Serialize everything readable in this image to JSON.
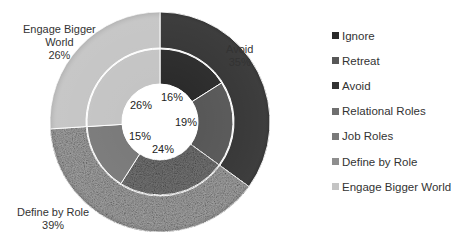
{
  "chart_data": {
    "type": "pie",
    "subtype": "nested-doughnut",
    "title": "",
    "series": [
      {
        "name": "Outer ring",
        "categories": [
          "Avoid",
          "Define by Role",
          "Engage Bigger World"
        ],
        "values": [
          35,
          39,
          26
        ],
        "labels": [
          "Avoid\n35%",
          "Define by Role\n39%",
          "Engage Bigger\nWorld\n26%"
        ]
      },
      {
        "name": "Inner ring",
        "categories": [
          "Ignore",
          "Retreat",
          "Relational Roles",
          "Job Roles",
          "Engage Bigger World"
        ],
        "values": [
          16,
          19,
          24,
          15,
          26
        ],
        "labels": [
          "16%",
          "19%",
          "24%",
          "15%",
          "26%"
        ]
      }
    ],
    "legend": [
      "Ignore",
      "Retreat",
      "Avoid",
      "Relational Roles",
      "Job Roles",
      "Define by Role",
      "Engage Bigger World"
    ],
    "legend_position": "right",
    "colors": {
      "Ignore": "#2a2a2a",
      "Retreat": "#575757",
      "Avoid": "#333333",
      "Relational Roles": "#6f6f6f",
      "Job Roles": "#7a7a7a",
      "Define by Role": "#9a9a9a",
      "Engage Bigger World": "#c4c4c4"
    }
  },
  "outer_labels": {
    "avoid": {
      "name": "Avoid",
      "pct": "35%"
    },
    "define": {
      "name": "Define by Role",
      "pct": "39%"
    },
    "engage": {
      "name1": "Engage Bigger",
      "name2": "World",
      "pct": "26%"
    }
  },
  "inner_labels": {
    "ignore": "16%",
    "retreat": "19%",
    "relational": "24%",
    "job": "15%",
    "engage": "26%"
  },
  "legend": [
    {
      "label": "Ignore",
      "color": "#2a2a2a"
    },
    {
      "label": "Retreat",
      "color": "#575757"
    },
    {
      "label": "Avoid",
      "color": "#333333"
    },
    {
      "label": "Relational Roles",
      "color": "#6f6f6f"
    },
    {
      "label": "Job Roles",
      "color": "#7a7a7a"
    },
    {
      "label": "Define by Role",
      "color": "#8e8e8e"
    },
    {
      "label": "Engage Bigger World",
      "color": "#c4c4c4"
    }
  ]
}
